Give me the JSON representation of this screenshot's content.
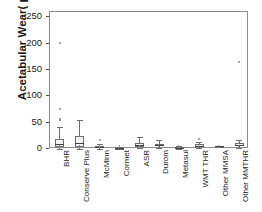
{
  "chart_data": {
    "type": "box",
    "title": "",
    "xlabel": "",
    "ylabel": "Acetabular Wear( μm/y)",
    "ylim": [
      0,
      260
    ],
    "yticks": [
      0,
      50,
      100,
      150,
      200,
      250
    ],
    "ytick_labels": [
      "0",
      "50",
      "100",
      "150",
      "200",
      "250"
    ],
    "grid": false,
    "legend": "none",
    "categories": [
      "BHR",
      "Conserve Plus",
      "McMinn",
      "Cormet",
      "ASR",
      "Durom",
      "Metasul",
      "WMT THR",
      "Other MMSA",
      "Other MMTHR"
    ],
    "boxes": [
      {
        "category": "BHR",
        "whisker_low": 0.5,
        "q1": 4,
        "median": 9,
        "q3": 19,
        "whisker_high": 42,
        "outliers": [
          55,
          57,
          75,
          202
        ]
      },
      {
        "category": "Conserve Plus",
        "whisker_low": 0.5,
        "q1": 3,
        "median": 11,
        "q3": 24,
        "whisker_high": 55,
        "outliers": []
      },
      {
        "category": "McMinn",
        "whisker_low": 0.5,
        "q1": 1.5,
        "median": 3,
        "q3": 5,
        "whisker_high": 9,
        "outliers": [
          17
        ]
      },
      {
        "category": "Cormet",
        "whisker_low": 1,
        "q1": 1.5,
        "median": 2,
        "q3": 2.5,
        "whisker_high": 3,
        "outliers": []
      },
      {
        "category": "ASR",
        "whisker_low": 1,
        "q1": 4,
        "median": 8,
        "q3": 12,
        "whisker_high": 22,
        "outliers": []
      },
      {
        "category": "Durom",
        "whisker_low": 2,
        "q1": 5,
        "median": 7,
        "q3": 10,
        "whisker_high": 17,
        "outliers": []
      },
      {
        "category": "Metasul",
        "whisker_low": 0.5,
        "q1": 1,
        "median": 2,
        "q3": 3,
        "whisker_high": 5,
        "outliers": []
      },
      {
        "category": "WMT THR",
        "whisker_low": 1,
        "q1": 4,
        "median": 6,
        "q3": 9,
        "whisker_high": 14,
        "outliers": [
          19
        ]
      },
      {
        "category": "Other MMSA",
        "whisker_low": 6,
        "q1": 6,
        "median": 6,
        "q3": 6,
        "whisker_high": 6,
        "outliers": []
      },
      {
        "category": "Other MMTHR",
        "whisker_low": 1,
        "q1": 5,
        "median": 8,
        "q3": 12,
        "whisker_high": 18,
        "outliers": [
          165
        ]
      }
    ]
  },
  "colors": {
    "box_fill": "#f2f2f2",
    "box_edge": "#6e6e6e",
    "median": "#404040",
    "outlier": "#8a8a8a",
    "frame": "#8c8c8c",
    "text": "#1a1a1a",
    "background": "#ffffff"
  }
}
